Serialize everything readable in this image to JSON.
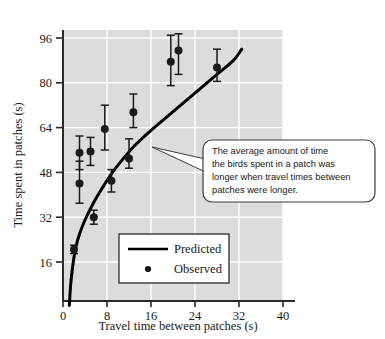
{
  "chart_data": {
    "type": "scatter",
    "title": "",
    "xlabel": "Travel time between patches (s)",
    "ylabel": "Time spent in patches (s)",
    "xlim": [
      0,
      40
    ],
    "ylim": [
      0,
      100
    ],
    "xticks": [
      0,
      8,
      16,
      24,
      32,
      40
    ],
    "yticks": [
      16,
      32,
      48,
      64,
      80,
      96
    ],
    "grid": true,
    "grid_color": "#ffffff",
    "plot_background": "#dcdcdc",
    "legend_position": "center-left-lower",
    "series": [
      {
        "name": "Observed",
        "type": "scatter",
        "marker": "filled-circle",
        "color": "#1a1a1a",
        "points": [
          {
            "x": 3.0,
            "y": 55.0,
            "yerr_low": 49.0,
            "yerr_high": 61.0
          },
          {
            "x": 3.0,
            "y": 44.0,
            "yerr_low": 37.0,
            "yerr_high": 52.0
          },
          {
            "x": 5.0,
            "y": 55.5,
            "yerr_low": 50.5,
            "yerr_high": 60.5
          },
          {
            "x": 5.6,
            "y": 32.0,
            "yerr_low": 29.5,
            "yerr_high": 34.5
          },
          {
            "x": 7.6,
            "y": 63.5,
            "yerr_low": 56.0,
            "yerr_high": 72.0
          },
          {
            "x": 8.8,
            "y": 45.0,
            "yerr_low": 41.0,
            "yerr_high": 49.0
          },
          {
            "x": 12.0,
            "y": 53.0,
            "yerr_low": 49.5,
            "yerr_high": 60.0
          },
          {
            "x": 12.8,
            "y": 69.5,
            "yerr_low": 64.0,
            "yerr_high": 76.0
          },
          {
            "x": 19.6,
            "y": 87.5,
            "yerr_low": 79.0,
            "yerr_high": 97.0
          },
          {
            "x": 21.0,
            "y": 91.5,
            "yerr_low": 83.0,
            "yerr_high": 97.5
          },
          {
            "x": 28.0,
            "y": 85.5,
            "yerr_low": 80.5,
            "yerr_high": 92.0
          },
          {
            "x": 2.0,
            "y": 20.5,
            "yerr_low": 19.0,
            "yerr_high": 22.0
          }
        ]
      },
      {
        "name": "Predicted",
        "type": "line",
        "color": "#000000",
        "curve_points": [
          {
            "x": 1.15,
            "y": 0.5
          },
          {
            "x": 1.4,
            "y": 8.0
          },
          {
            "x": 1.8,
            "y": 15.0
          },
          {
            "x": 2.3,
            "y": 21.0
          },
          {
            "x": 3.0,
            "y": 26.0
          },
          {
            "x": 4.0,
            "y": 31.0
          },
          {
            "x": 5.5,
            "y": 37.0
          },
          {
            "x": 7.0,
            "y": 42.0
          },
          {
            "x": 9.0,
            "y": 48.0
          },
          {
            "x": 11.0,
            "y": 53.0
          },
          {
            "x": 13.0,
            "y": 57.5
          },
          {
            "x": 16.0,
            "y": 63.0
          },
          {
            "x": 19.0,
            "y": 68.0
          },
          {
            "x": 22.0,
            "y": 73.0
          },
          {
            "x": 25.0,
            "y": 78.0
          },
          {
            "x": 28.0,
            "y": 83.0
          },
          {
            "x": 31.0,
            "y": 88.0
          },
          {
            "x": 32.5,
            "y": 92.0
          }
        ]
      }
    ]
  },
  "axes": {
    "x_title": "Travel time between patches (s)",
    "y_title": "Time spent in patches (s)",
    "x_tick_labels": [
      "0",
      "8",
      "16",
      "24",
      "32",
      "40"
    ],
    "y_tick_labels": [
      "16",
      "32",
      "48",
      "64",
      "80",
      "96"
    ]
  },
  "legend": {
    "items": [
      {
        "label": "Predicted",
        "kind": "line"
      },
      {
        "label": "Observed",
        "kind": "dot"
      }
    ]
  },
  "callout": {
    "lines": [
      "The average amount of time",
      "the birds spent in a patch was",
      "longer when travel times between",
      "patches were longer."
    ]
  },
  "colors": {
    "plot_bg": "#dcdcdc",
    "grid": "#ffffff",
    "ink": "#1a1a1a",
    "callout_bg": "#ffffff",
    "callout_border": "#3b3b3b"
  }
}
